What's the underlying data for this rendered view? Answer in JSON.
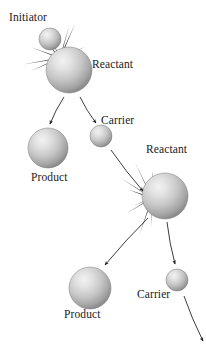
{
  "figure": {
    "kind": "chain-reaction-diagram",
    "background_color": "#ffffff",
    "ink_color": "#1a1a1a"
  },
  "palette": {
    "sphere_highlight": "#ececec",
    "sphere_mid": "#c8c8c8",
    "sphere_edge": "#8f8f8f",
    "sphere_rim": "#7a7a7a",
    "burst_dark": "#1c1c1c",
    "burst_mid": "#4a4a4a",
    "arrow": "#1a1a1a"
  },
  "labels": {
    "initiator": "Initiator",
    "reactant_top": "Reactant",
    "carrier_middle": "Carrier",
    "product_upper": "Product",
    "reactant_lower": "Reactant",
    "product_lower": "Product",
    "carrier_lower": "Carrier"
  },
  "label_positions": {
    "initiator": {
      "x": 9,
      "y": 12
    },
    "reactant_top": {
      "x": 92,
      "y": 59
    },
    "carrier_middle": {
      "x": 101,
      "y": 115
    },
    "product_upper": {
      "x": 31,
      "y": 172
    },
    "reactant_lower": {
      "x": 146,
      "y": 144
    },
    "product_lower": {
      "x": 64,
      "y": 309
    },
    "carrier_lower": {
      "x": 137,
      "y": 289
    }
  },
  "spheres": [
    {
      "name": "initiator-sphere",
      "cx": 50,
      "cy": 39,
      "r": 11
    },
    {
      "name": "reactant-top-sphere",
      "cx": 69,
      "cy": 70,
      "r": 23
    },
    {
      "name": "carrier-middle-sphere",
      "cx": 101,
      "cy": 136,
      "r": 11
    },
    {
      "name": "product-upper-sphere",
      "cx": 48,
      "cy": 148,
      "r": 20
    },
    {
      "name": "reactant-lower-sphere",
      "cx": 165,
      "cy": 196,
      "r": 23
    },
    {
      "name": "product-lower-sphere",
      "cx": 90,
      "cy": 288,
      "r": 21
    },
    {
      "name": "carrier-lower-sphere",
      "cx": 177,
      "cy": 280,
      "r": 11
    }
  ],
  "bursts": [
    {
      "name": "collision-burst-top",
      "cx": 60,
      "cy": 58,
      "spikes": 14,
      "min_len": 20,
      "max_len": 38
    },
    {
      "name": "collision-burst-lower",
      "cx": 152,
      "cy": 198,
      "spikes": 14,
      "min_len": 20,
      "max_len": 40
    }
  ],
  "arrows": [
    {
      "name": "arrow-reactant-to-product-upper",
      "x1": 64,
      "y1": 97,
      "x2": 50,
      "y2": 124
    },
    {
      "name": "arrow-reactant-to-carrier",
      "x1": 80,
      "y1": 97,
      "x2": 96,
      "y2": 123
    },
    {
      "name": "arrow-carrier-to-reactant-lower",
      "x1": 111,
      "y1": 150,
      "x2": 143,
      "y2": 191
    },
    {
      "name": "arrow-reactant-to-product-lower",
      "x1": 148,
      "y1": 218,
      "x2": 105,
      "y2": 265
    },
    {
      "name": "arrow-reactant-to-carrier-lower",
      "x1": 167,
      "y1": 222,
      "x2": 175,
      "y2": 264
    },
    {
      "name": "arrow-carrier-to-offscreen",
      "x1": 184,
      "y1": 296,
      "x2": 203,
      "y2": 341
    }
  ],
  "flow_sequence": [
    "Initiator",
    "Reactant",
    "Product",
    "Carrier",
    "Reactant",
    "Product",
    "Carrier"
  ]
}
